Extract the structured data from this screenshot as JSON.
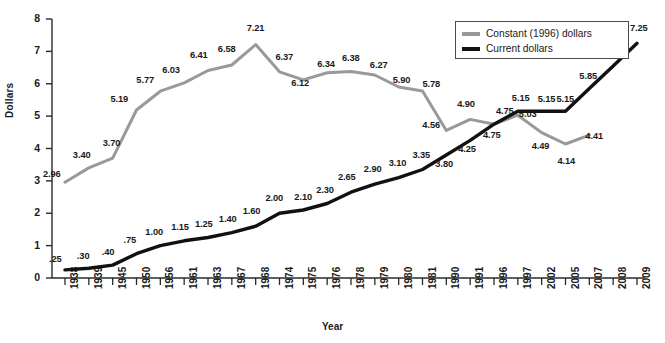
{
  "chart_data": {
    "type": "line",
    "title": "",
    "xlabel": "Year",
    "ylabel": "Dollars",
    "ylim": [
      0,
      8
    ],
    "yticks": [
      "0",
      "1",
      "2",
      "3",
      "4",
      "5",
      "6",
      "7",
      "8"
    ],
    "grid": false,
    "legend_position": "top-right",
    "categories": [
      "1938",
      "1939",
      "1945",
      "1950",
      "1956",
      "1961",
      "1963",
      "1967",
      "1968",
      "1974",
      "1975",
      "1976",
      "1978",
      "1979",
      "1980",
      "1981",
      "1990",
      "1991",
      "1996",
      "1997",
      "2002",
      "2005",
      "2007",
      "2008",
      "2009"
    ],
    "series": [
      {
        "name": "Constant (1996) dollars",
        "color": "#999999",
        "values": [
          2.96,
          3.4,
          3.7,
          5.19,
          5.77,
          6.03,
          6.41,
          6.58,
          7.21,
          6.37,
          6.12,
          6.34,
          6.38,
          6.27,
          5.9,
          5.78,
          4.56,
          4.9,
          4.75,
          5.03,
          4.49,
          4.14,
          4.41,
          null,
          null
        ],
        "labels": [
          "2.96",
          "3.40",
          "3.70",
          "5.19",
          "5.77",
          "6.03",
          "6.41",
          "6.58",
          "7.21",
          "6.37",
          "6.12",
          "6.34",
          "6.38",
          "6.27",
          "5.90",
          "5.78",
          "4.56",
          "4.90",
          "4.75",
          "5.03",
          "4.49",
          "4.14",
          "4.41",
          "",
          ""
        ]
      },
      {
        "name": "Current dollars",
        "color": "#111111",
        "values": [
          0.25,
          0.3,
          0.4,
          0.75,
          1.0,
          1.15,
          1.25,
          1.4,
          1.6,
          2.0,
          2.1,
          2.3,
          2.65,
          2.9,
          3.1,
          3.35,
          3.8,
          4.25,
          4.75,
          5.15,
          5.15,
          5.15,
          5.85,
          6.55,
          7.25
        ],
        "labels": [
          ".25",
          ".30",
          ".40",
          ".75",
          "1.00",
          "1.15",
          "1.25",
          "1.40",
          "1.60",
          "2.00",
          "2.10",
          "2.30",
          "2.65",
          "2.90",
          "3.10",
          "3.35",
          "3.80",
          "4.25",
          "4.75",
          "5.15",
          "5.15",
          "5.15",
          "5.85",
          "6.55",
          "7.25"
        ]
      }
    ]
  },
  "legend": {
    "entries": [
      {
        "label": "Constant (1996) dollars",
        "color": "#999999"
      },
      {
        "label": "Current dollars",
        "color": "#111111"
      }
    ]
  },
  "axes": {
    "y_title": "Dollars",
    "x_title": "Year"
  }
}
